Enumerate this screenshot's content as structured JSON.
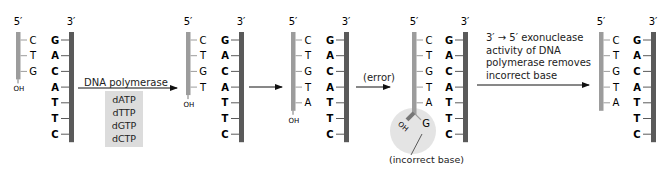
{
  "colors": {
    "template_strand": "#5a5a5a",
    "new_strand": "#9c9c9c",
    "new_base_text": "#9a9a9a",
    "template_base_text": "#333333",
    "dntp_box": "#dcdcdc",
    "error_highlight": "#e4e4e4",
    "arrow": "#111111"
  },
  "labels": {
    "five_prime": "5′",
    "three_prime": "3′",
    "oh": "OH"
  },
  "template_strand": [
    "G",
    "A",
    "C",
    "A",
    "T",
    "T",
    "C"
  ],
  "panels": [
    {
      "id": "panel-1",
      "new_bases": [
        "C",
        "T",
        "G"
      ]
    },
    {
      "id": "panel-2",
      "new_bases": [
        "C",
        "T",
        "G",
        "T"
      ]
    },
    {
      "id": "panel-3",
      "new_bases": [
        "C",
        "T",
        "G",
        "T",
        "A"
      ]
    },
    {
      "id": "panel-4",
      "new_bases": [
        "C",
        "T",
        "G",
        "T",
        "A"
      ],
      "mismatched_base": "G"
    },
    {
      "id": "panel-5",
      "new_bases": [
        "C",
        "T",
        "G",
        "T",
        "A"
      ]
    }
  ],
  "steps": {
    "step1": {
      "label": "DNA polymerase",
      "dntps": [
        "dATP",
        "dTTP",
        "dGTP",
        "dCTP"
      ]
    },
    "step2": {
      "label": ""
    },
    "step3": {
      "label": "(error)"
    },
    "step4": {
      "lines": [
        "3′ → 5′ exonuclease",
        "activity of DNA",
        "polymerase removes",
        "incorrect base"
      ]
    }
  },
  "annotations": {
    "incorrect_base": "(incorrect base)"
  }
}
